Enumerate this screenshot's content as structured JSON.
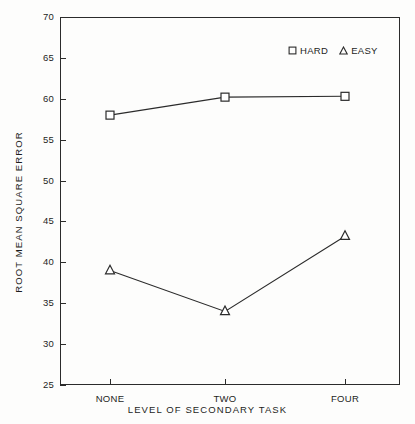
{
  "chart_data": {
    "type": "line",
    "title": "",
    "xlabel": "LEVEL OF SECONDARY TASK",
    "ylabel": "ROOT MEAN SQUARE ERROR",
    "categories": [
      "NONE",
      "TWO",
      "FOUR"
    ],
    "series": [
      {
        "name": "HARD",
        "marker": "square",
        "values": [
          58.0,
          60.2,
          60.3
        ]
      },
      {
        "name": "EASY",
        "marker": "triangle",
        "values": [
          39.0,
          34.0,
          43.2
        ]
      }
    ],
    "ylim": [
      25,
      70
    ],
    "yticks": [
      25,
      30,
      35,
      40,
      45,
      50,
      55,
      60,
      65,
      70
    ],
    "ytick_labels": [
      "25",
      "30",
      "35",
      "40",
      "45",
      "50",
      "55",
      "60",
      "65",
      "70"
    ],
    "xtick_labels": [
      "NONE",
      "TWO",
      "FOUR"
    ],
    "grid": false,
    "legend": {
      "position": "top-right",
      "entries": [
        {
          "label": "HARD",
          "glyph": "square-open-marker"
        },
        {
          "label": "EASY",
          "glyph": "triangle-open-marker"
        }
      ]
    },
    "colors": {
      "line": "#2b2b2b",
      "axis": "#2b2b2b",
      "text": "#1d1d1d",
      "background": "#fdfdfc"
    }
  }
}
